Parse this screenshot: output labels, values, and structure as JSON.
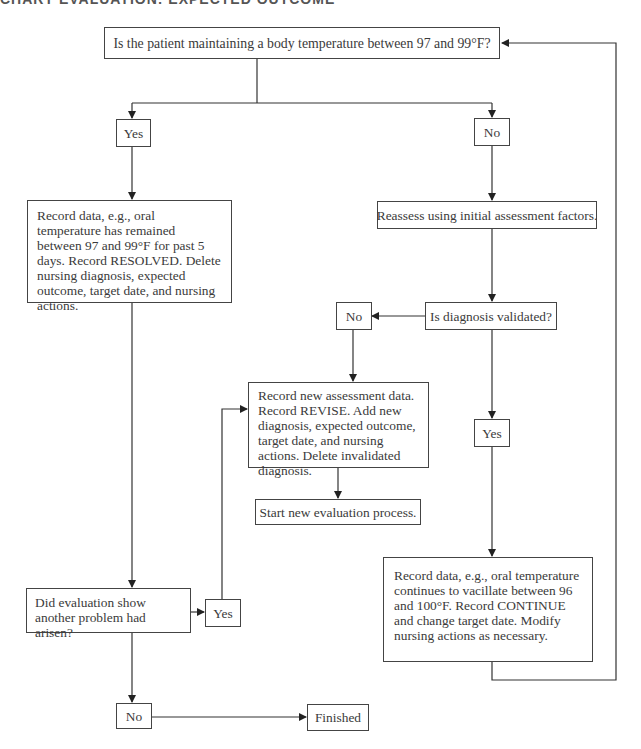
{
  "header": {
    "title": "CHART EVALUATION: EXPECTED OUTCOME"
  },
  "flowchart": {
    "start_question": "Is the patient maintaining a body temperature between 97 and 99°F?",
    "yes_label": "Yes",
    "no_label": "No",
    "resolved_action": "Record data, e.g., oral temperature has remained between 97 and 99°F for past 5 days. Record RESOLVED. Delete nursing diagnosis, expected outcome, target date, and nursing actions.",
    "reassess_action": "Reassess using initial assessment factors.",
    "diagnosis_question": "Is diagnosis validated?",
    "diagnosis_no_label": "No",
    "diagnosis_yes_label": "Yes",
    "revise_action": "Record new assessment data. Record REVISE. Add new diagnosis, expected outcome, target date, and nursing actions. Delete invalidated diagnosis.",
    "start_new_action": "Start new evaluation process.",
    "continue_action": "Record data, e.g., oral temperature continues to vacillate between 96 and 100°F. Record CONTINUE and change target date. Modify nursing actions as necessary.",
    "another_problem_question": "Did evaluation show another problem had arisen?",
    "another_yes_label": "Yes",
    "another_no_label": "No",
    "finished_label": "Finished"
  },
  "colors": {
    "line": "#333333",
    "text": "#3a3a3a",
    "background": "#ffffff"
  }
}
